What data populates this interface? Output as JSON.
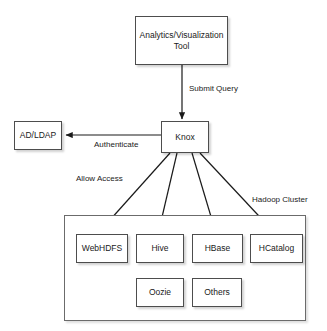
{
  "diagram": {
    "colors": {
      "background": "#ffffff",
      "node_fill": "#ffffff",
      "node_border": "#4d4d4d",
      "cluster_border": "#6b6b6b",
      "text": "#1a1a1a",
      "edge": "#1a1a1a"
    },
    "nodes": {
      "analytics_tool": "Analytics/Visualization Tool",
      "knox": "Knox",
      "ad_ldap": "AD/LDAP",
      "webhdfs": "WebHDFS",
      "hive": "Hive",
      "hbase": "HBase",
      "hcatalog": "HCatalog",
      "oozie": "Oozie",
      "others": "Others"
    },
    "edge_labels": {
      "submit_query": "Submit Query",
      "authenticate": "Authenticate",
      "allow_access": "Allow Access",
      "hadoop_cluster": "Hadoop Cluster"
    },
    "edges": [
      {
        "from": "analytics_tool",
        "to": "knox",
        "label": "Submit Query"
      },
      {
        "from": "knox",
        "to": "ad_ldap",
        "label": "Authenticate"
      },
      {
        "from": "knox",
        "to": "webhdfs",
        "label": "Allow Access"
      },
      {
        "from": "knox",
        "to": "hive",
        "label": ""
      },
      {
        "from": "knox",
        "to": "hbase",
        "label": ""
      },
      {
        "from": "knox",
        "to": "hcatalog",
        "label": ""
      }
    ]
  }
}
